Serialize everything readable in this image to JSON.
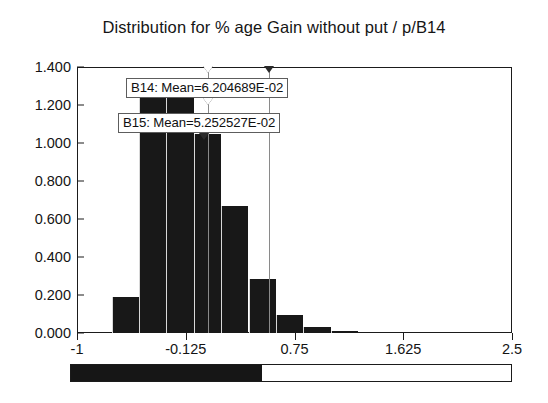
{
  "chart_data": {
    "type": "bar",
    "title": "Distribution for % age Gain without put / p/B14",
    "xlabel": "",
    "ylabel": "",
    "xlim": [
      -1,
      2.5
    ],
    "ylim": [
      0,
      1.4
    ],
    "grid": false,
    "legend": "none",
    "x_ticks": [
      "-1",
      "-0.125",
      "0.75",
      "1.625",
      "2.5"
    ],
    "x_tick_values": [
      -1,
      -0.125,
      0.75,
      1.625,
      2.5
    ],
    "y_ticks": [
      "0.000",
      "0.200",
      "0.400",
      "0.600",
      "0.800",
      "1.000",
      "1.200",
      "1.400"
    ],
    "y_tick_values": [
      0,
      0.2,
      0.4,
      0.6,
      0.8,
      1.0,
      1.2,
      1.4
    ],
    "bin_edges": [
      -0.72,
      -0.5,
      -0.28,
      -0.06,
      0.16,
      0.38,
      0.6,
      0.82,
      1.04,
      1.26
    ],
    "categories": [
      "-0.72",
      "-0.50",
      "-0.28",
      "-0.06",
      "0.16",
      "0.38",
      "0.60",
      "0.82",
      "1.04"
    ],
    "values": [
      0.19,
      1.27,
      1.27,
      1.05,
      0.67,
      0.285,
      0.095,
      0.03,
      0.012
    ],
    "annotations": [
      {
        "name": "B14",
        "label": "B14: Mean=6.204689E-02",
        "value": 0.06204689,
        "marker": "hollow"
      },
      {
        "name": "B15",
        "label": "B15: Mean=5.252527E-02",
        "value": 0.05252527,
        "marker": "solid"
      }
    ],
    "delimiters": [
      {
        "name": "delimiter-left",
        "value": 0.056,
        "marker": "hollow"
      },
      {
        "name": "delimiter-right",
        "value": 0.545,
        "marker": "solid"
      }
    ]
  },
  "slider": {
    "name": "range-slider",
    "fill_percent": 43.5
  },
  "colors": {
    "bar": "#181818",
    "frame": "#1b1b1b",
    "delimiter": "#8a8a8a",
    "text": "#111111",
    "background": "#ffffff"
  }
}
